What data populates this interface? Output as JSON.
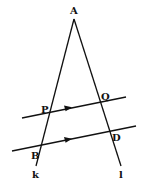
{
  "figure": {
    "colors": {
      "stroke": "#111111",
      "background": "#ffffff"
    },
    "points": {
      "A": {
        "label": "A",
        "x": 74,
        "y": 19
      },
      "P": {
        "label": "P",
        "x": 49,
        "y": 113
      },
      "Q": {
        "label": "Q",
        "x": 100,
        "y": 102
      },
      "B": {
        "label": "B",
        "x": 41,
        "y": 145
      },
      "D": {
        "label": "D",
        "x": 110,
        "y": 132
      }
    },
    "lines": {
      "k": {
        "label": "k"
      },
      "l": {
        "label": "l"
      }
    },
    "parallel_marks": [
      "arrow-on-PQ",
      "arrow-on-BD"
    ]
  }
}
